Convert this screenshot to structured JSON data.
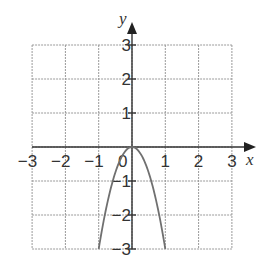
{
  "chart_data": {
    "type": "line",
    "title": "",
    "xlabel": "x",
    "ylabel": "y",
    "xlim": [
      -3,
      3
    ],
    "ylim": [
      -3,
      3
    ],
    "grid": true,
    "x_ticks": [
      "-3",
      "-2",
      "-1",
      "1",
      "2",
      "3"
    ],
    "y_ticks": [
      "3",
      "2",
      "1",
      "-1",
      "-2",
      "-3"
    ],
    "origin_label": "0",
    "series": [
      {
        "name": "y = -3x^2",
        "x": [
          -1,
          -0.75,
          -0.5,
          -0.25,
          0,
          0.25,
          0.5,
          0.75,
          1
        ],
        "y": [
          -3,
          -1.6875,
          -0.75,
          -0.1875,
          0,
          -0.1875,
          -0.75,
          -1.6875,
          -3
        ]
      }
    ]
  }
}
